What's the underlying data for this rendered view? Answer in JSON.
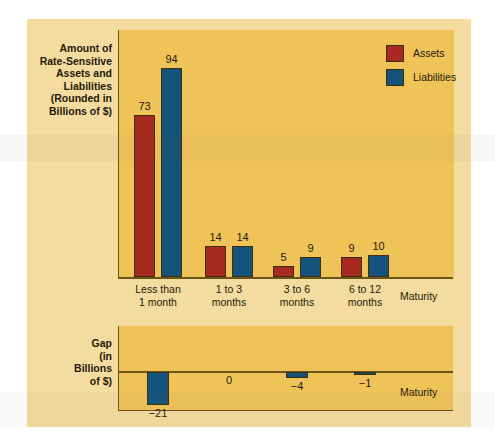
{
  "figure": {
    "background_color": "#f4dca0",
    "plot_background_color": "#f0c359",
    "axis_color": "#6d5418"
  },
  "upper": {
    "axis_caption": "Amount of\nRate-Sensitive\nAssets and\nLiabilities\n(Rounded in\nBillions of $)",
    "axis_caption_lines": [
      "Amount of",
      "Rate-Sensitive",
      "Assets and",
      "Liabilities",
      "(Rounded in",
      "Billions of $)"
    ],
    "x_axis_name": "Maturity",
    "legend": [
      {
        "label": "Assets",
        "color": "#a8291f"
      },
      {
        "label": "Liabilities",
        "color": "#14537c"
      }
    ],
    "categories": [
      {
        "line1": "Less than",
        "line2": "1 month"
      },
      {
        "line1": "1 to 3",
        "line2": "months"
      },
      {
        "line1": "3 to 6",
        "line2": "months"
      },
      {
        "line1": "6 to 12",
        "line2": "months"
      }
    ],
    "assets": [
      "73",
      "14",
      "5",
      "9"
    ],
    "liabilities": [
      "94",
      "14",
      "9",
      "10"
    ]
  },
  "lower": {
    "axis_caption_lines": [
      "Gap",
      "(in",
      "Billions",
      "of $)"
    ],
    "x_axis_name": "Maturity",
    "values": [
      "−21",
      "0",
      "−4",
      "−1"
    ]
  },
  "chart_data": {
    "type": "bar",
    "title": "",
    "panels": [
      {
        "name": "rate-sensitive-assets-and-liabilities",
        "type": "bar",
        "ylabel": "Amount of Rate-Sensitive Assets and Liabilities (Rounded in Billions of $)",
        "xlabel": "Maturity",
        "categories": [
          "Less than 1 month",
          "1 to 3 months",
          "3 to 6 months",
          "6 to 12 months"
        ],
        "series": [
          {
            "name": "Assets",
            "color": "#a8291f",
            "values": [
              73,
              14,
              5,
              9
            ]
          },
          {
            "name": "Liabilities",
            "color": "#14537c",
            "values": [
              94,
              14,
              9,
              10
            ]
          }
        ],
        "ylim": [
          0,
          100
        ],
        "grid": false,
        "legend_position": "top-right",
        "data_labels": true
      },
      {
        "name": "gap",
        "type": "bar",
        "ylabel": "Gap (in Billions of $)",
        "xlabel": "Maturity",
        "categories": [
          "Less than 1 month",
          "1 to 3 months",
          "3 to 6 months",
          "6 to 12 months"
        ],
        "series": [
          {
            "name": "Gap",
            "color": "#14537c",
            "values": [
              -21,
              0,
              -4,
              -1
            ]
          }
        ],
        "ylim": [
          -25,
          5
        ],
        "grid": false,
        "legend_position": "none",
        "data_labels": true
      }
    ]
  }
}
